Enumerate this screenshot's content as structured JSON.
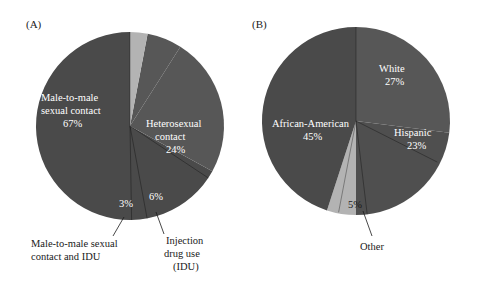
{
  "figure": {
    "background_color": "#ffffff",
    "panels": [
      {
        "tag": "(A)",
        "tag_name": "panel-a-tag",
        "center_x": 130,
        "center_y": 126,
        "radius": 94
      },
      {
        "tag": "(B)",
        "tag_name": "panel-b-tag",
        "center_x": 356,
        "center_y": 121,
        "radius": 94
      }
    ]
  },
  "colors": {
    "dark_slice": "#4a4a4a",
    "mid_slice": "#575757",
    "light_slice": "#b3b3b3",
    "label_light": "#ffffff",
    "label_dark": "#1a1a1a",
    "separator": "#000000"
  },
  "panel_a": {
    "tag": "(A)",
    "labels": {
      "male_to_male_line1": "Male-to-male",
      "male_to_male_line2": "sexual contact",
      "male_to_male_pct": "67%",
      "heterosexual_line1": "Heterosexual",
      "heterosexual_line2": "contact",
      "heterosexual_pct": "24%",
      "idu_pct_inside": "3%",
      "heterosexual_idu_pct_inside": "6%",
      "mm_idu_line1": "Male-to-male sexual",
      "mm_idu_line2": "contact and IDU",
      "injection_line1": "Injection",
      "injection_line2": "drug use",
      "injection_line3": "(IDU)"
    }
  },
  "panel_b": {
    "tag": "(B)",
    "labels": {
      "white_name": "White",
      "white_pct": "27%",
      "hispanic_name": "Hispanic",
      "hispanic_pct": "23%",
      "african_american_name": "African-American",
      "african_american_pct": "45%",
      "other_pct_inside": "5%",
      "other_name": "Other"
    }
  },
  "chart_data": [
    {
      "type": "pie",
      "id": "panel-a",
      "title": "(A)",
      "unit": "percent",
      "total": 100,
      "legend": "none",
      "labels_inside": true,
      "categories": [
        "Male-to-male sexual contact",
        "Heterosexual contact",
        "Injection drug use (IDU)",
        "Male-to-male sexual contact and IDU"
      ],
      "values": [
        67,
        24,
        6,
        3
      ],
      "slice_colors": [
        "#4a4a4a",
        "#575757",
        "#575757",
        "#b3b3b3"
      ],
      "label_placement": [
        "inside",
        "inside",
        "outside",
        "outside"
      ],
      "start_angle_deg": 0,
      "direction": "counterclockwise"
    },
    {
      "type": "pie",
      "id": "panel-b",
      "title": "(B)",
      "unit": "percent",
      "total": 100,
      "legend": "none",
      "labels_inside": true,
      "categories": [
        "White",
        "Hispanic",
        "Other",
        "African-American"
      ],
      "values": [
        27,
        23,
        5,
        45
      ],
      "slice_colors": [
        "#575757",
        "#4f4f4f",
        "#b3b3b3",
        "#4a4a4a"
      ],
      "label_placement": [
        "inside",
        "inside",
        "outside",
        "inside"
      ],
      "start_angle_deg": 0,
      "direction": "clockwise"
    }
  ]
}
